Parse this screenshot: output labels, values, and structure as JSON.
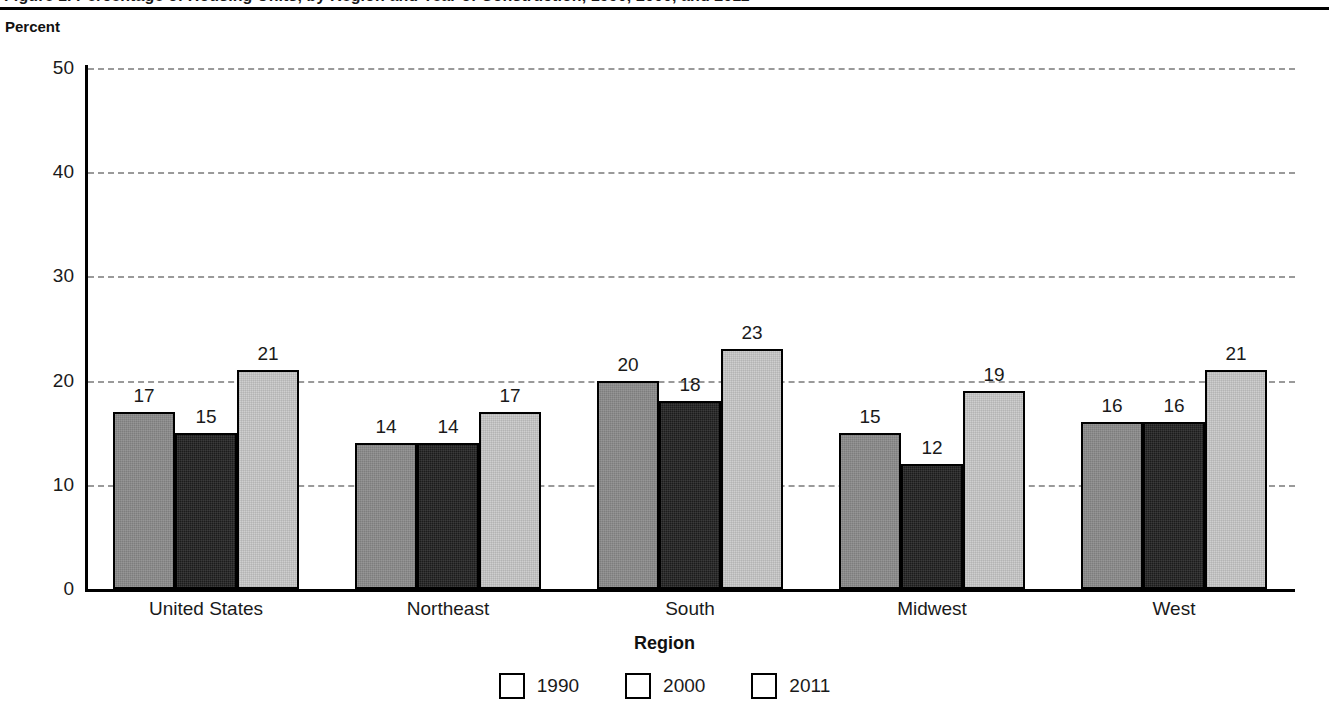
{
  "figure": {
    "title_cut_off": "Figure 1. Percentage of Housing Units, by Region and Year of Construction, 1990, 2000, and 2011",
    "y_axis_caption": "Percent",
    "x_axis_title": "Region"
  },
  "chart_data": {
    "type": "bar",
    "title": "",
    "xlabel": "Region",
    "ylabel": "Percent",
    "ylim": [
      0,
      50
    ],
    "yticks": [
      0,
      10,
      20,
      30,
      40,
      50
    ],
    "grid": true,
    "legend_position": "bottom",
    "categories": [
      "United States",
      "Northeast",
      "South",
      "Midwest",
      "West"
    ],
    "series": [
      {
        "name": "1990",
        "color": "#7d7d7d",
        "values": [
          17,
          14,
          20,
          15,
          16
        ]
      },
      {
        "name": "2000",
        "color": "#1c1c1c",
        "values": [
          15,
          14,
          18,
          12,
          16
        ]
      },
      {
        "name": "2011",
        "color": "#cfcfcf",
        "values": [
          21,
          17,
          23,
          19,
          21
        ]
      }
    ]
  }
}
